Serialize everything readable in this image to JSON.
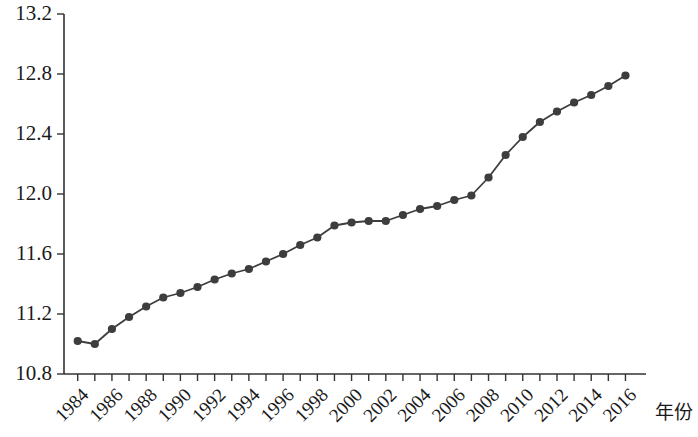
{
  "chart_data": {
    "type": "line",
    "title": "",
    "subtitle": "",
    "xlabel": "年份",
    "ylabel": "",
    "xlim": [
      1983.2,
      2017.2
    ],
    "ylim": [
      10.8,
      13.2
    ],
    "grid": false,
    "legend": null,
    "marker": "filled-circle",
    "line_color": "#3d3d3d",
    "marker_color": "#3d3d3d",
    "y_ticks": [
      10.8,
      11.2,
      11.6,
      12.0,
      12.4,
      12.8,
      13.2
    ],
    "y_tick_labels": [
      "10.8",
      "11.2",
      "11.6",
      "12.0",
      "12.4",
      "12.8",
      "13.2"
    ],
    "x_ticks": [
      1984,
      1985,
      1986,
      1987,
      1988,
      1989,
      1990,
      1991,
      1992,
      1993,
      1994,
      1995,
      1996,
      1997,
      1998,
      1999,
      2000,
      2001,
      2002,
      2003,
      2004,
      2005,
      2006,
      2007,
      2008,
      2009,
      2010,
      2011,
      2012,
      2013,
      2014,
      2015,
      2016
    ],
    "x_tick_labels": [
      "1984",
      "1986",
      "1988",
      "1990",
      "1992",
      "1994",
      "1996",
      "1998",
      "2000",
      "2002",
      "2004",
      "2006",
      "2008",
      "2010",
      "2012",
      "2014",
      "2016"
    ],
    "x_tick_label_years": [
      1984,
      1986,
      1988,
      1990,
      1992,
      1994,
      1996,
      1998,
      2000,
      2002,
      2004,
      2006,
      2008,
      2010,
      2012,
      2014,
      2016
    ],
    "x_tick_label_rotation": -45,
    "x": [
      1984,
      1985,
      1986,
      1987,
      1988,
      1989,
      1990,
      1991,
      1992,
      1993,
      1994,
      1995,
      1996,
      1997,
      1998,
      1999,
      2000,
      2001,
      2002,
      2003,
      2004,
      2005,
      2006,
      2007,
      2008,
      2009,
      2010,
      2011,
      2012,
      2013,
      2014,
      2015,
      2016
    ],
    "values": [
      11.02,
      11.0,
      11.1,
      11.18,
      11.25,
      11.31,
      11.34,
      11.38,
      11.43,
      11.47,
      11.5,
      11.55,
      11.6,
      11.66,
      11.71,
      11.79,
      11.81,
      11.82,
      11.82,
      11.86,
      11.9,
      11.92,
      11.96,
      11.99,
      12.11,
      12.26,
      12.38,
      12.48,
      12.55,
      12.61,
      12.66,
      12.72,
      12.79
    ]
  }
}
